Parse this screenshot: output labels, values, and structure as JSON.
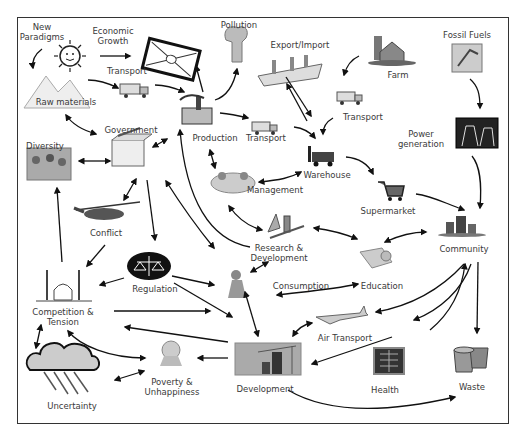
{
  "diagram": {
    "type": "concept-map",
    "nodes": [
      {
        "id": "new_paradigms",
        "label_lines": [
          "New",
          "Paradigms"
        ],
        "icon": "sun-icon"
      },
      {
        "id": "economic_growth",
        "label_lines": [
          "Economic",
          "Growth"
        ],
        "icon": "banknote-icon"
      },
      {
        "id": "pollution",
        "label_lines": [
          "Pollution"
        ],
        "icon": "smokestack-icon"
      },
      {
        "id": "export_import",
        "label_lines": [
          "Export/Import"
        ],
        "icon": "cargo-ship-icon"
      },
      {
        "id": "farm",
        "label_lines": [
          "Farm"
        ],
        "icon": "barn-icon"
      },
      {
        "id": "fossil_fuels",
        "label_lines": [
          "Fossil Fuels"
        ],
        "icon": "oil-pump-icon"
      },
      {
        "id": "raw_materials",
        "label_lines": [
          "Raw materials"
        ],
        "icon": "mountains-icon"
      },
      {
        "id": "transport_1",
        "label_lines": [
          "Transport"
        ],
        "icon": "truck-icon"
      },
      {
        "id": "production",
        "label_lines": [
          "Production"
        ],
        "icon": "factory-icon"
      },
      {
        "id": "transport_2",
        "label_lines": [
          "Transport"
        ],
        "icon": "truck-icon"
      },
      {
        "id": "transport_3",
        "label_lines": [
          "Transport"
        ],
        "icon": "truck-icon"
      },
      {
        "id": "power_generation",
        "label_lines": [
          "Power",
          "generation"
        ],
        "icon": "power-plant-icon"
      },
      {
        "id": "government",
        "label_lines": [
          "Government"
        ],
        "icon": "ballot-box-icon"
      },
      {
        "id": "diversity",
        "label_lines": [
          "Diversity"
        ],
        "icon": "crowd-icon"
      },
      {
        "id": "management",
        "label_lines": [
          "Management"
        ],
        "icon": "meeting-icon"
      },
      {
        "id": "warehouse",
        "label_lines": [
          "Warehouse"
        ],
        "icon": "forklift-icon"
      },
      {
        "id": "supermarket",
        "label_lines": [
          "Supermarket"
        ],
        "icon": "shopping-cart-icon"
      },
      {
        "id": "conflict",
        "label_lines": [
          "Conflict"
        ],
        "icon": "helicopter-icon"
      },
      {
        "id": "research_development",
        "label_lines": [
          "Research &",
          "Development"
        ],
        "icon": "lab-flask-icon"
      },
      {
        "id": "community",
        "label_lines": [
          "Community"
        ],
        "icon": "city-icon"
      },
      {
        "id": "regulation",
        "label_lines": [
          "Regulation"
        ],
        "icon": "scales-icon"
      },
      {
        "id": "consumption",
        "label_lines": [
          "Consumption"
        ],
        "icon": "shopper-icon"
      },
      {
        "id": "education",
        "label_lines": [
          "Education"
        ],
        "icon": "books-icon"
      },
      {
        "id": "competition_tension",
        "label_lines": [
          "Competition &",
          "Tension"
        ],
        "icon": "mosque-icon"
      },
      {
        "id": "air_transport",
        "label_lines": [
          "Air Transport"
        ],
        "icon": "airplane-icon"
      },
      {
        "id": "uncertainty",
        "label_lines": [
          "Uncertainty"
        ],
        "icon": "rain-cloud-icon"
      },
      {
        "id": "poverty_unhappiness",
        "label_lines": [
          "Poverty &",
          "Unhappiness"
        ],
        "icon": "sad-person-icon"
      },
      {
        "id": "development",
        "label_lines": [
          "Development"
        ],
        "icon": "construction-site-icon"
      },
      {
        "id": "health",
        "label_lines": [
          "Health"
        ],
        "icon": "xray-icon"
      },
      {
        "id": "waste",
        "label_lines": [
          "Waste"
        ],
        "icon": "trash-bins-icon"
      }
    ],
    "edges": [
      {
        "from": "new_paradigms",
        "to": "raw_materials"
      },
      {
        "from": "new_paradigms",
        "to": "economic_growth"
      },
      {
        "from": "raw_materials",
        "to": "transport_1"
      },
      {
        "from": "transport_1",
        "to": "production"
      },
      {
        "from": "production",
        "to": "economic_growth"
      },
      {
        "from": "production",
        "to": "pollution"
      },
      {
        "from": "production",
        "to": "transport_2"
      },
      {
        "from": "raw_materials",
        "to": "government",
        "bidirectional": true
      },
      {
        "from": "government",
        "to": "production",
        "bidirectional": true
      },
      {
        "from": "diversity",
        "to": "government",
        "bidirectional": true
      },
      {
        "from": "farm",
        "to": "transport_3"
      },
      {
        "from": "export_import",
        "to": "warehouse",
        "bidirectional": true
      },
      {
        "from": "transport_2",
        "to": "warehouse"
      },
      {
        "from": "transport_3",
        "to": "warehouse"
      },
      {
        "from": "fossil_fuels",
        "to": "power_generation"
      },
      {
        "from": "power_generation",
        "to": "community"
      },
      {
        "from": "warehouse",
        "to": "supermarket"
      },
      {
        "from": "supermarket",
        "to": "community"
      },
      {
        "from": "production",
        "to": "management",
        "bidirectional": true
      },
      {
        "from": "management",
        "to": "warehouse",
        "bidirectional": true
      },
      {
        "from": "management",
        "to": "research_development",
        "bidirectional": true
      },
      {
        "from": "government",
        "to": "conflict",
        "bidirectional": true
      },
      {
        "from": "government",
        "to": "regulation"
      },
      {
        "from": "government",
        "to": "research_development",
        "bidirectional": true
      },
      {
        "from": "research_development",
        "to": "production"
      },
      {
        "from": "research_development",
        "to": "education",
        "bidirectional": true
      },
      {
        "from": "education",
        "to": "community",
        "bidirectional": true
      },
      {
        "from": "conflict",
        "to": "competition_tension"
      },
      {
        "from": "competition_tension",
        "to": "diversity"
      },
      {
        "from": "regulation",
        "to": "competition_tension"
      },
      {
        "from": "regulation",
        "to": "consumption"
      },
      {
        "from": "regulation",
        "to": "development"
      },
      {
        "from": "consumption",
        "to": "research_development",
        "bidirectional": true
      },
      {
        "from": "consumption",
        "to": "education",
        "bidirectional": true
      },
      {
        "from": "consumption",
        "to": "development",
        "bidirectional": true
      },
      {
        "from": "competition_tension",
        "to": "consumption"
      },
      {
        "from": "development",
        "to": "competition_tension"
      },
      {
        "from": "competition_tension",
        "to": "poverty_unhappiness",
        "bidirectional": true
      },
      {
        "from": "competition_tension",
        "to": "uncertainty",
        "bidirectional": true
      },
      {
        "from": "uncertainty",
        "to": "poverty_unhappiness",
        "bidirectional": true
      },
      {
        "from": "development",
        "to": "poverty_unhappiness"
      },
      {
        "from": "air_transport",
        "to": "development",
        "bidirectional": true
      },
      {
        "from": "community",
        "to": "air_transport"
      },
      {
        "from": "community",
        "to": "development"
      },
      {
        "from": "community",
        "to": "health"
      },
      {
        "from": "community",
        "to": "waste"
      },
      {
        "from": "development",
        "to": "community"
      },
      {
        "from": "development",
        "to": "waste"
      }
    ]
  },
  "labels": {
    "new_paradigms": [
      "New",
      "Paradigms"
    ],
    "economic_growth": [
      "Economic",
      "Growth"
    ],
    "pollution": "Pollution",
    "export_import": "Export/Import",
    "farm": "Farm",
    "fossil_fuels": "Fossil Fuels",
    "raw_materials": "Raw materials",
    "transport_1": "Transport",
    "production": "Production",
    "transport_2": "Transport",
    "transport_3": "Transport",
    "power_generation": [
      "Power",
      "generation"
    ],
    "government": "Government",
    "diversity": "Diversity",
    "management": "Management",
    "warehouse": "Warehouse",
    "supermarket": "Supermarket",
    "conflict": "Conflict",
    "research_development": [
      "Research &",
      "Development"
    ],
    "community": "Community",
    "regulation": "Regulation",
    "consumption": "Consumption",
    "education": "Education",
    "competition_tension": [
      "Competition &",
      "Tension"
    ],
    "air_transport": "Air Transport",
    "uncertainty": "Uncertainty",
    "poverty_unhappiness": [
      "Poverty &",
      "Unhappiness"
    ],
    "development": "Development",
    "health": "Health",
    "waste": "Waste"
  }
}
